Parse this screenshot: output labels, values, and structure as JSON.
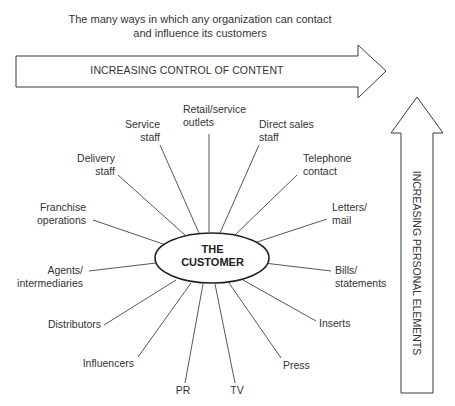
{
  "caption": {
    "line1": "The many ways in which any organization can contact",
    "line2": "and influence its customers"
  },
  "horizontal_arrow": {
    "label": "INCREASING CONTROL OF CONTENT",
    "direction": "right"
  },
  "vertical_arrow": {
    "label": "INCREASING PERSONAL ELEMENTS",
    "direction": "up"
  },
  "center": {
    "line1": "THE",
    "line2": "CUSTOMER"
  },
  "channels": [
    {
      "id": "retail",
      "line1": "Retail/service",
      "line2": "outlets"
    },
    {
      "id": "service-staff",
      "line1": "Service",
      "line2": "staff"
    },
    {
      "id": "direct-sales",
      "line1": "Direct sales",
      "line2": "staff"
    },
    {
      "id": "delivery-staff",
      "line1": "Delivery",
      "line2": "staff"
    },
    {
      "id": "telephone",
      "line1": "Telephone",
      "line2": "contact"
    },
    {
      "id": "franchise",
      "line1": "Franchise",
      "line2": "operations"
    },
    {
      "id": "letters",
      "line1": "Letters/",
      "line2": "mail"
    },
    {
      "id": "agents",
      "line1": "Agents/",
      "line2": "intermediaries"
    },
    {
      "id": "bills",
      "line1": "Bills/",
      "line2": "statements"
    },
    {
      "id": "distributors",
      "line1": "Distributors"
    },
    {
      "id": "inserts",
      "line1": "Inserts"
    },
    {
      "id": "influencers",
      "line1": "Influencers"
    },
    {
      "id": "press",
      "line1": "Press"
    },
    {
      "id": "pr",
      "line1": "PR"
    },
    {
      "id": "tv",
      "line1": "TV"
    }
  ]
}
